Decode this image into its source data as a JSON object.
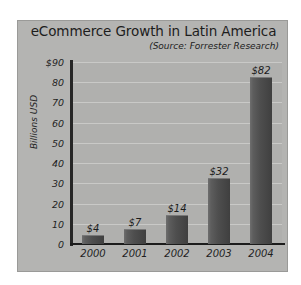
{
  "chart_data": {
    "type": "bar",
    "title": "eCommerce Growth in Latin America",
    "subtitle": "(Source: Forrester Research)",
    "xlabel": "",
    "ylabel": "Billions USD",
    "categories": [
      "2000",
      "2001",
      "2002",
      "2003",
      "2004"
    ],
    "values": [
      4,
      7,
      14,
      32,
      82
    ],
    "value_labels": [
      "$4",
      "$7",
      "$14",
      "$32",
      "$82"
    ],
    "ylim": [
      0,
      90
    ],
    "yticks": [
      0,
      10,
      20,
      30,
      40,
      50,
      60,
      70,
      80,
      90
    ],
    "ytick_labels": [
      "0",
      "10",
      "20",
      "30",
      "40",
      "50",
      "60",
      "70",
      "80",
      "$90"
    ],
    "grid": true,
    "legend": null,
    "colors": {
      "page_background": "#ffffff",
      "panel_background": "#b4b4b2",
      "plot_background": "#b0b0ae",
      "gridline": "#c9c9c7",
      "axis_line": "#1c1c1c",
      "bar_fill": "#4e4e4e",
      "text": "#1d1d1d"
    }
  }
}
